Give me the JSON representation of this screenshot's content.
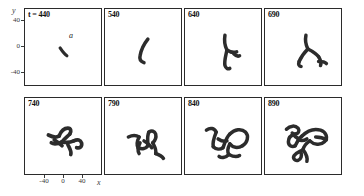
{
  "figure": {
    "axes": {
      "y_label": "y",
      "x_label": "x",
      "y_ticks": [
        "40",
        "0",
        "-40"
      ],
      "x_ticks": [
        "-40",
        "0",
        "40"
      ],
      "y_range": [
        -60,
        60
      ],
      "x_range": [
        -60,
        60
      ]
    },
    "annotations": {
      "point_a": "a"
    },
    "panels": [
      {
        "label": "t = 440",
        "time": 440
      },
      {
        "label": "540",
        "time": 540
      },
      {
        "label": "640",
        "time": 640
      },
      {
        "label": "690",
        "time": 690
      },
      {
        "label": "740",
        "time": 740
      },
      {
        "label": "790",
        "time": 790
      },
      {
        "label": "840",
        "time": 840
      },
      {
        "label": "890",
        "time": 890
      }
    ]
  },
  "chart_data": {
    "type": "scatter",
    "title": "",
    "subtitle": "",
    "xlabel": "x",
    "ylabel": "y",
    "xlim": [
      -60,
      60
    ],
    "ylim": [
      -60,
      60
    ],
    "grid": false,
    "legend": null,
    "panel_layout": {
      "rows": 2,
      "cols": 4
    },
    "shared_axes": true,
    "x_ticks": [
      -40,
      0,
      40
    ],
    "y_ticks": [
      -40,
      0,
      40
    ],
    "annotations": [
      {
        "text": "a",
        "panel": 0,
        "x": 8,
        "y": 12
      }
    ],
    "series": [
      {
        "name": "t = 440",
        "panel": 0,
        "description": "short straight filament segment near origin",
        "stroke_width": 3.2,
        "paths": [
          "M 36 40 C 38 43, 40 46, 43 48"
        ]
      },
      {
        "name": "540",
        "panel": 1,
        "description": "elongated slightly curved filament",
        "stroke_width": 3.6,
        "paths": [
          "M 44 31 C 40 36, 37 42, 36 48 C 35 52, 37 54, 40 55"
        ]
      },
      {
        "name": "640",
        "panel": 2,
        "description": "Y-shaped branched filament",
        "stroke_width": 3.6,
        "paths": [
          "M 41 27 C 40 33, 41 38, 43 42",
          "M 43 42 C 46 44, 50 45, 53 44",
          "M 43 42 C 42 48, 40 53, 41 58 C 42 61, 44 62, 46 61",
          "M 50 46 C 52 48, 54 49, 56 48"
        ]
      },
      {
        "name": "690",
        "panel": 3,
        "description": "branched filament with hook and side arms",
        "stroke_width": 3.6,
        "paths": [
          "M 42 27 C 41 32, 42 37, 44 41",
          "M 44 41 C 48 43, 52 45, 55 49",
          "M 44 41 C 40 45, 37 49, 35 54",
          "M 35 54 C 34 57, 35 59, 37 59",
          "M 55 49 C 57 52, 58 55, 57 58",
          "M 55 54 C 58 54, 61 54, 63 56"
        ]
      },
      {
        "name": "740",
        "panel": 4,
        "description": "dense tangled cluster, compact",
        "stroke_width": 3.8,
        "paths": [
          "M 24 38 C 28 40, 32 41, 35 39",
          "M 35 39 C 37 34, 40 31, 44 31 C 47 31, 48 34, 46 37",
          "M 46 37 C 43 40, 40 42, 38 45",
          "M 38 45 C 34 47, 30 48, 27 46",
          "M 38 45 C 42 46, 46 46, 50 44",
          "M 50 44 C 54 42, 57 43, 58 46 C 59 50, 56 52, 53 51",
          "M 44 48 C 46 52, 48 55, 47 58",
          "M 30 43 C 33 45, 36 47, 38 49"
        ]
      },
      {
        "name": "790",
        "panel": 5,
        "description": "spread tangled structure with descending tail",
        "stroke_width": 3.6,
        "paths": [
          "M 24 40 C 28 38, 32 38, 35 40",
          "M 35 40 C 33 44, 32 48, 34 51",
          "M 34 51 C 38 53, 42 52, 44 49",
          "M 44 49 C 44 44, 43 39, 45 35",
          "M 45 35 C 48 33, 51 34, 52 37 C 53 41, 51 44, 49 46",
          "M 49 46 C 51 50, 53 53, 52 57",
          "M 52 57 C 55 58, 58 59, 60 62",
          "M 40 44 C 43 46, 46 48, 48 51",
          "M 36 46 C 34 50, 33 54, 35 57"
        ]
      },
      {
        "name": "840",
        "panel": 6,
        "description": "large looped structure with open ring and lower tail",
        "stroke_width": 3.6,
        "paths": [
          "M 22 33 C 26 30, 30 31, 32 35",
          "M 32 35 C 30 40, 28 45, 29 50",
          "M 29 50 C 32 53, 36 53, 39 51",
          "M 39 51 C 41 46, 42 41, 46 37",
          "M 46 37 C 51 32, 58 31, 62 35 C 66 39, 64 46, 59 49",
          "M 59 49 C 54 52, 49 51, 46 47",
          "M 46 47 C 44 51, 43 55, 45 58",
          "M 45 58 C 42 61, 38 62, 35 60",
          "M 45 58 C 49 60, 53 61, 56 59",
          "M 34 42 C 37 44, 40 45, 43 44"
        ]
      },
      {
        "name": "890",
        "panel": 7,
        "description": "most complex, multiple loops and branches",
        "stroke_width": 3.6,
        "paths": [
          "M 22 32 C 26 28, 31 28, 34 31 C 36 34, 34 37, 31 37",
          "M 31 37 C 27 38, 24 41, 24 45 C 24 49, 28 51, 31 49",
          "M 31 49 C 33 45, 35 41, 38 39",
          "M 38 39 C 43 34, 50 31, 57 33 C 63 35, 65 41, 61 45 C 57 49, 50 48, 46 44",
          "M 46 44 C 43 46, 40 49, 39 53",
          "M 39 53 C 36 55, 32 56, 30 59 C 28 62, 31 65, 34 64 C 37 63, 38 59, 37 56",
          "M 39 53 C 42 57, 44 61, 43 65",
          "M 34 43 C 37 44, 40 44, 43 42",
          "M 52 40 C 56 40, 60 41, 63 43",
          "M 28 36 C 30 39, 32 41, 35 42"
        ]
      }
    ]
  }
}
